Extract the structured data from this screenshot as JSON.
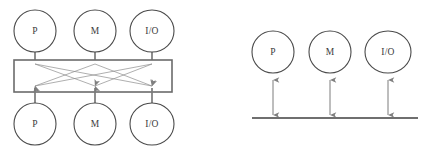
{
  "figure": {
    "background_color": "#ffffff",
    "line_color": "#6f6f6f",
    "node_stroke_color": "#4a4a4a",
    "label_color": "#3a3a3a"
  },
  "diagrams": [
    {
      "id": "crossbar",
      "name": "crossbar-switch-diagram",
      "type": "crossbar",
      "inputs": [
        {
          "label": "P",
          "cx": 35,
          "cy": 31,
          "rx": 21,
          "ry": 21
        },
        {
          "label": "M",
          "cx": 95,
          "cy": 31,
          "rx": 21,
          "ry": 21
        },
        {
          "label": "I/O",
          "cx": 152,
          "cy": 31,
          "rx": 22,
          "ry": 21
        }
      ],
      "outputs": [
        {
          "label": "P",
          "cx": 35,
          "cy": 124,
          "rx": 21,
          "ry": 21
        },
        {
          "label": "M",
          "cx": 95,
          "cy": 124,
          "rx": 21,
          "ry": 21
        },
        {
          "label": "I/O",
          "cx": 152,
          "cy": 124,
          "rx": 22,
          "ry": 21
        }
      ],
      "switch_box": {
        "x": 14,
        "y": 60,
        "width": 158,
        "height": 32
      },
      "column_x": [
        35,
        95,
        152
      ],
      "crossings": [
        {
          "from": 0,
          "to": 1
        },
        {
          "from": 0,
          "to": 2
        },
        {
          "from": 1,
          "to": 0
        },
        {
          "from": 1,
          "to": 2
        },
        {
          "from": 2,
          "to": 0
        },
        {
          "from": 2,
          "to": 1
        }
      ]
    },
    {
      "id": "bus",
      "name": "shared-bus-diagram",
      "type": "bus",
      "nodes": [
        {
          "label": "P",
          "cx": 273,
          "cy": 52,
          "rx": 21,
          "ry": 21
        },
        {
          "label": "M",
          "cx": 330,
          "cy": 52,
          "rx": 21,
          "ry": 21
        },
        {
          "label": "I/O",
          "cx": 388,
          "cy": 52,
          "rx": 23,
          "ry": 21
        }
      ],
      "bus_line": {
        "x1": 252,
        "y1": 118,
        "x2": 418,
        "y2": 118
      },
      "connection_style": "bidirectional"
    }
  ]
}
